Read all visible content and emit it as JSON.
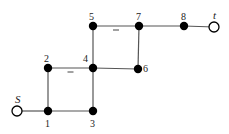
{
  "diagram": {
    "type": "graph",
    "nodes": [
      {
        "id": "S",
        "label": "S",
        "kind": "source",
        "style": "open"
      },
      {
        "id": "1",
        "label": "1",
        "kind": "internal",
        "style": "filled"
      },
      {
        "id": "2",
        "label": "2",
        "kind": "internal",
        "style": "filled"
      },
      {
        "id": "3",
        "label": "3",
        "kind": "internal",
        "style": "filled"
      },
      {
        "id": "4",
        "label": "4",
        "kind": "internal",
        "style": "filled"
      },
      {
        "id": "5",
        "label": "5",
        "kind": "internal",
        "style": "filled"
      },
      {
        "id": "6",
        "label": "6",
        "kind": "internal",
        "style": "filled"
      },
      {
        "id": "7",
        "label": "7",
        "kind": "internal",
        "style": "filled"
      },
      {
        "id": "8",
        "label": "8",
        "kind": "internal",
        "style": "filled"
      },
      {
        "id": "t",
        "label": "t",
        "kind": "sink",
        "style": "open"
      }
    ],
    "edges": [
      {
        "from": "S",
        "to": "1",
        "mark": ""
      },
      {
        "from": "1",
        "to": "3",
        "mark": ""
      },
      {
        "from": "1",
        "to": "2",
        "mark": ""
      },
      {
        "from": "2",
        "to": "4",
        "mark": "−"
      },
      {
        "from": "3",
        "to": "4",
        "mark": ""
      },
      {
        "from": "4",
        "to": "6",
        "mark": ""
      },
      {
        "from": "4",
        "to": "5",
        "mark": ""
      },
      {
        "from": "5",
        "to": "7",
        "mark": "−"
      },
      {
        "from": "7",
        "to": "6",
        "mark": ""
      },
      {
        "from": "7",
        "to": "8",
        "mark": ""
      },
      {
        "from": "8",
        "to": "t",
        "mark": ""
      }
    ]
  }
}
